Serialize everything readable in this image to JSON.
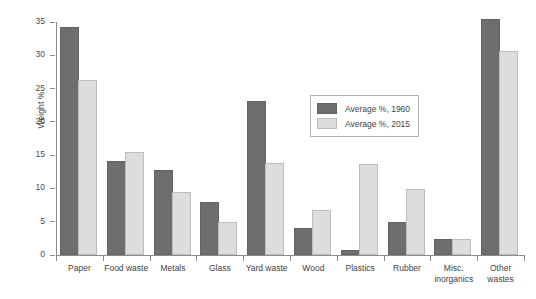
{
  "chart_data": {
    "type": "bar",
    "title": "",
    "xlabel": "",
    "ylabel": "Weight %",
    "ylim": [
      0,
      35
    ],
    "yticks": [
      0,
      5,
      10,
      15,
      20,
      25,
      30,
      35
    ],
    "grid": false,
    "legend_position": "center-right",
    "categories": [
      "Paper",
      "Food waste",
      "Metals",
      "Glass",
      "Yard waste",
      "Wood",
      "Plastics",
      "Rubber",
      "Misc.\ninorganics",
      "Other\nwastes"
    ],
    "series": [
      {
        "name": "Average %, 1960",
        "color": "#6e6e6e",
        "values": [
          34.0,
          13.8,
          12.4,
          7.6,
          22.8,
          3.8,
          0.4,
          4.6,
          2.1,
          35.2
        ]
      },
      {
        "name": "Average %, 2015",
        "color": "#dddddd",
        "values": [
          26.0,
          15.2,
          9.2,
          4.6,
          13.5,
          6.5,
          13.4,
          9.6,
          2.1,
          30.4
        ]
      }
    ]
  },
  "legend": {
    "items": [
      {
        "label": "Average %, 1960"
      },
      {
        "label": "Average %, 2015"
      }
    ]
  },
  "axis": {
    "y_label": "Weight %",
    "y_tick_labels": [
      "0",
      "5",
      "10",
      "15",
      "20",
      "25",
      "30",
      "35"
    ],
    "x_tick_labels": [
      "Paper",
      "Food waste",
      "Metals",
      "Glass",
      "Yard waste",
      "Wood",
      "Plastics",
      "Rubber",
      "Misc. inorganics",
      "Other wastes"
    ]
  }
}
